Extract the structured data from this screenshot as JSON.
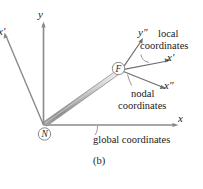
{
  "figure": {
    "caption": "(b)",
    "background_color": "#ffffff",
    "line_color": "#7a7a7a",
    "text_color": "#1a1a1a"
  },
  "axes": {
    "global_y": "y",
    "global_x": "x",
    "offscreen_left": "x'",
    "local_y": "y″",
    "local_x": "x'",
    "nodal_x": "x″"
  },
  "nodes": {
    "near": "N",
    "far": "F"
  },
  "annotations": {
    "local_line1": "local",
    "local_line2": "coordinates",
    "nodal_line1": "nodal",
    "nodal_line2": "coordinates",
    "global_label": "global coordinates"
  },
  "element": {
    "name": "beam-element",
    "fill_light": "#f2f2f2",
    "fill_mid": "#b9b9b9",
    "fill_dark": "#8e8e8e"
  }
}
